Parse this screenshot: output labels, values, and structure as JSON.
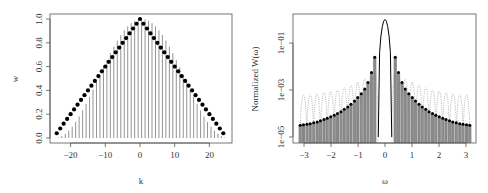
{
  "chart_data": [
    {
      "type": "scatter",
      "title": "",
      "xlabel": "k",
      "ylabel": "w",
      "xlim": [
        -25.5,
        26.5
      ],
      "ylim": [
        -0.015,
        1.04
      ],
      "grid": false,
      "legend": "none",
      "xticks": [
        -20,
        -10,
        0,
        10,
        20
      ],
      "xtick_labels": [
        "−20",
        "−10",
        "0",
        "10",
        "20"
      ],
      "yticks": [
        0.0,
        0.2,
        0.4,
        0.6,
        0.8,
        1.0
      ],
      "ytick_labels": [
        "0.0",
        "0.2",
        "0.4",
        "0.6",
        "0.8",
        "1.0"
      ],
      "series": [
        {
          "name": "Bartlett window (points)",
          "style": "points",
          "color": "#000000",
          "x": [
            -24,
            -23,
            -22,
            -21,
            -20,
            -19,
            -18,
            -17,
            -16,
            -15,
            -14,
            -13,
            -12,
            -11,
            -10,
            -9,
            -8,
            -7,
            -6,
            -5,
            -4,
            -3,
            -2,
            -1,
            0,
            1,
            2,
            3,
            4,
            5,
            6,
            7,
            8,
            9,
            10,
            11,
            12,
            13,
            14,
            15,
            16,
            17,
            18,
            19,
            20,
            21,
            22,
            23,
            24
          ],
          "values": [
            0.04,
            0.08,
            0.12,
            0.16,
            0.2,
            0.24,
            0.28,
            0.32,
            0.36,
            0.4,
            0.44,
            0.48,
            0.52,
            0.56,
            0.6,
            0.64,
            0.68,
            0.72,
            0.76,
            0.8,
            0.84,
            0.88,
            0.92,
            0.96,
            1.0,
            0.96,
            0.92,
            0.88,
            0.84,
            0.8,
            0.76,
            0.72,
            0.68,
            0.64,
            0.6,
            0.56,
            0.52,
            0.48,
            0.44,
            0.4,
            0.36,
            0.32,
            0.28,
            0.24,
            0.2,
            0.16,
            0.12,
            0.08,
            0.04
          ]
        },
        {
          "name": "Tukey-Hanning window (vertical lines)",
          "style": "h",
          "color": "#888888",
          "x": [
            -24,
            -23,
            -22,
            -21,
            -20,
            -19,
            -18,
            -17,
            -16,
            -15,
            -14,
            -13,
            -12,
            -11,
            -10,
            -9,
            -8,
            -7,
            -6,
            -5,
            -4,
            -3,
            -2,
            -1,
            0,
            1,
            2,
            3,
            4,
            5,
            6,
            7,
            8,
            9,
            10,
            11,
            12,
            13,
            14,
            15,
            16,
            17,
            18,
            19,
            20,
            21,
            22,
            23,
            24
          ],
          "values": [
            0.004,
            0.016,
            0.035,
            0.062,
            0.095,
            0.135,
            0.181,
            0.232,
            0.287,
            0.345,
            0.406,
            0.469,
            0.531,
            0.594,
            0.655,
            0.713,
            0.768,
            0.819,
            0.865,
            0.905,
            0.938,
            0.965,
            0.984,
            0.996,
            1.0,
            0.996,
            0.984,
            0.965,
            0.938,
            0.905,
            0.865,
            0.819,
            0.768,
            0.713,
            0.655,
            0.594,
            0.531,
            0.469,
            0.406,
            0.345,
            0.287,
            0.232,
            0.181,
            0.135,
            0.095,
            0.062,
            0.035,
            0.016,
            0.004
          ]
        }
      ]
    },
    {
      "type": "line",
      "title": "",
      "xlabel": "ω",
      "ylabel": "Normalized W(ω)",
      "yscale": "log",
      "xlim": [
        -3.4,
        3.4
      ],
      "ylim": [
        7e-06,
        1.6
      ],
      "grid": false,
      "legend": "none",
      "xticks": [
        -3,
        -2,
        -1,
        0,
        1,
        2,
        3
      ],
      "xtick_labels": [
        "−3",
        "−2",
        "−1",
        "0",
        "1",
        "2",
        "3"
      ],
      "yticks": [
        1e-05,
        0.001,
        0.1
      ],
      "ytick_labels": [
        "1e−05",
        "1e−03",
        "1e−01"
      ],
      "series": [
        {
          "name": "Bartlett spectral window (dotted)",
          "style": "dotted",
          "color": "#999999",
          "sidelobe_peaks_omega": [
            -3.02,
            -2.77,
            -2.52,
            -2.26,
            -2.01,
            -1.76,
            -1.51,
            -1.26,
            -1.01,
            -0.75,
            -0.5,
            -0.38,
            0.38,
            0.5,
            0.75,
            1.01,
            1.26,
            1.51,
            1.76,
            2.01,
            2.26,
            2.52,
            2.77,
            3.02
          ],
          "sidelobe_peaks_value": [
            0.0016,
            0.0017,
            0.0019,
            0.0022,
            0.0026,
            0.0032,
            0.0042,
            0.0058,
            0.0085,
            0.014,
            0.028,
            0.047,
            0.047,
            0.028,
            0.014,
            0.0085,
            0.0058,
            0.0042,
            0.0032,
            0.0026,
            0.0022,
            0.0019,
            0.0017,
            0.0016
          ]
        },
        {
          "name": "Main lobe (solid)",
          "style": "line",
          "color": "#000000",
          "x": [
            -0.25,
            -0.2,
            -0.15,
            -0.1,
            -0.05,
            0,
            0.05,
            0.1,
            0.15,
            0.2,
            0.25
          ],
          "values": [
            1e-05,
            0.04,
            0.2,
            0.5,
            0.85,
            1.0,
            0.85,
            0.5,
            0.2,
            0.04,
            1e-05
          ]
        },
        {
          "name": "Tukey-Hanning spectral window (points + gray bars)",
          "style": "h+points",
          "color": "#000000",
          "bar_color": "#888888",
          "x": [
            -3.14,
            -3.02,
            -2.89,
            -2.77,
            -2.64,
            -2.51,
            -2.39,
            -2.26,
            -2.14,
            -2.01,
            -1.88,
            -1.76,
            -1.63,
            -1.51,
            -1.38,
            -1.26,
            -1.13,
            -1.01,
            -0.88,
            -0.75,
            -0.63,
            -0.5,
            -0.38,
            0.38,
            0.5,
            0.63,
            0.75,
            0.88,
            1.01,
            1.13,
            1.26,
            1.38,
            1.51,
            1.63,
            1.76,
            1.88,
            2.01,
            2.14,
            2.26,
            2.39,
            2.51,
            2.64,
            2.77,
            2.89,
            3.02,
            3.14
          ],
          "values": [
            3.2e-05,
            3.3e-05,
            3.5e-05,
            3.7e-05,
            4e-05,
            4.4e-05,
            4.9e-05,
            5.5e-05,
            6.3e-05,
            7.2e-05,
            8.5e-05,
            0.0001,
            0.00012,
            0.00015,
            0.00019,
            0.00025,
            0.00034,
            0.00048,
            0.0007,
            0.0011,
            0.0021,
            0.0055,
            0.025,
            0.025,
            0.0055,
            0.0021,
            0.0011,
            0.0007,
            0.00048,
            0.00034,
            0.00025,
            0.00019,
            0.00015,
            0.00012,
            0.0001,
            8.5e-05,
            7.2e-05,
            6.3e-05,
            5.5e-05,
            4.9e-05,
            4.4e-05,
            4e-05,
            3.7e-05,
            3.5e-05,
            3.3e-05,
            3.2e-05
          ]
        }
      ]
    }
  ]
}
